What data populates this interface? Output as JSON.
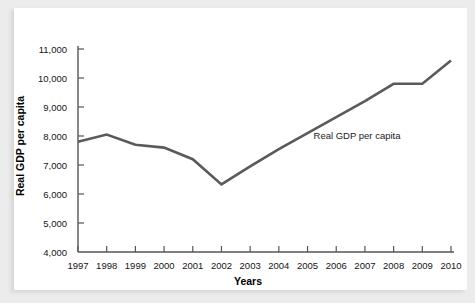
{
  "chart_data": {
    "type": "line",
    "title": "",
    "subtitle": "",
    "xlabel": "Years",
    "ylabel": "Real GDP per capita",
    "x": [
      1997,
      1998,
      1999,
      2000,
      2001,
      2002,
      2003,
      2004,
      2005,
      2006,
      2007,
      2008,
      2009,
      2010
    ],
    "xtick_labels": [
      "1997",
      "1998",
      "1999",
      "2000",
      "2001",
      "2002",
      "2003",
      "2004",
      "2005",
      "2006",
      "2007",
      "2008",
      "2009",
      "2010"
    ],
    "ytick_labels": [
      "4,000",
      "5,000",
      "6,000",
      "7,000",
      "8,000",
      "9,000",
      "10,000",
      "11,000"
    ],
    "ytick_values": [
      4000,
      5000,
      6000,
      7000,
      8000,
      9000,
      10000,
      11000
    ],
    "ylim": [
      4000,
      11000
    ],
    "xlim": [
      1997,
      2010
    ],
    "grid": false,
    "legend_position": "inline-annotation",
    "series": [
      {
        "name": "Real GDP per capita",
        "color": "#5a5a5a",
        "values": [
          7800,
          8050,
          7700,
          7600,
          7200,
          6330,
          6950,
          7550,
          8100,
          8650,
          9200,
          9800,
          9800,
          10600
        ]
      }
    ],
    "annotations": [
      {
        "text": "Real GDP per capita",
        "x": 2005,
        "y": 7900
      }
    ],
    "axis_color": "#555555",
    "background_color": "#ffffff",
    "page_background_color": "#ececec"
  }
}
